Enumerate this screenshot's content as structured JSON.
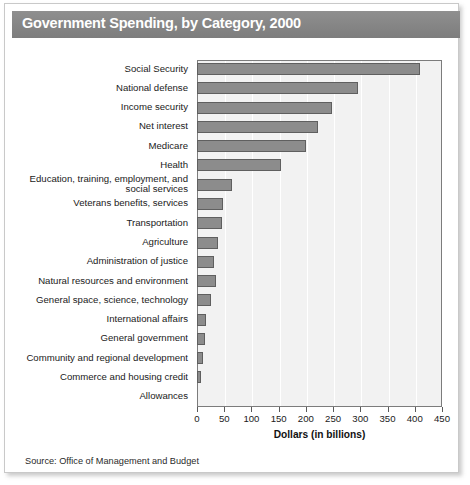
{
  "figure": {
    "title": "Government Spending, by Category, 2000",
    "source": "Source: Office of Management and Budget",
    "title_band_color": "#8a8a8a",
    "bar_color": "#8c8c8c",
    "plot_bg_color": "#f2f2f2"
  },
  "chart_data": {
    "type": "bar",
    "orientation": "horizontal",
    "title": "Government Spending, by Category, 2000",
    "xlabel": "Dollars (in billions)",
    "ylabel": "",
    "xlim": [
      0,
      450
    ],
    "xticks": [
      0,
      50,
      100,
      150,
      200,
      250,
      300,
      350,
      400,
      450
    ],
    "xtick_labels": [
      "0",
      "50",
      "100",
      "150",
      "200",
      "250",
      "300",
      "350",
      "400",
      "450"
    ],
    "grid": "vertical",
    "legend": "none",
    "units": "billions of dollars",
    "categories": [
      "Social Security",
      "National defense",
      "Income security",
      "Net interest",
      "Medicare",
      "Health",
      "Education, training, employment, and social services",
      "Veterans benefits, services",
      "Transportation",
      "Agriculture",
      "Administration of justice",
      "Natural resources and environment",
      "General space,  science, technology",
      "International affairs",
      "General government",
      "Community and regional development",
      "Commerce and housing credit",
      "Allowances"
    ],
    "values": [
      409,
      295,
      248,
      222,
      200,
      155,
      64,
      48,
      46,
      38,
      32,
      34,
      25,
      17,
      14,
      11,
      8,
      0
    ]
  },
  "rows": [
    {
      "label_line1": "Social Security",
      "label_line2": "",
      "value": 409
    },
    {
      "label_line1": "National defense",
      "label_line2": "",
      "value": 295
    },
    {
      "label_line1": "Income security",
      "label_line2": "",
      "value": 248
    },
    {
      "label_line1": "Net interest",
      "label_line2": "",
      "value": 222
    },
    {
      "label_line1": "Medicare",
      "label_line2": "",
      "value": 200
    },
    {
      "label_line1": "Health",
      "label_line2": "",
      "value": 155
    },
    {
      "label_line1": "Education, training, employment, and",
      "label_line2": "social services",
      "value": 64
    },
    {
      "label_line1": "Veterans benefits, services",
      "label_line2": "",
      "value": 48
    },
    {
      "label_line1": "Transportation",
      "label_line2": "",
      "value": 46
    },
    {
      "label_line1": "Agriculture",
      "label_line2": "",
      "value": 38
    },
    {
      "label_line1": "Administration of justice",
      "label_line2": "",
      "value": 32
    },
    {
      "label_line1": "Natural resources and environment",
      "label_line2": "",
      "value": 34
    },
    {
      "label_line1": "General space,  science, technology",
      "label_line2": "",
      "value": 25
    },
    {
      "label_line1": "International affairs",
      "label_line2": "",
      "value": 17
    },
    {
      "label_line1": "General government",
      "label_line2": "",
      "value": 14
    },
    {
      "label_line1": "Community and regional development",
      "label_line2": "",
      "value": 11
    },
    {
      "label_line1": "Commerce and housing credit",
      "label_line2": "",
      "value": 8
    },
    {
      "label_line1": "Allowances",
      "label_line2": "",
      "value": 0
    }
  ]
}
